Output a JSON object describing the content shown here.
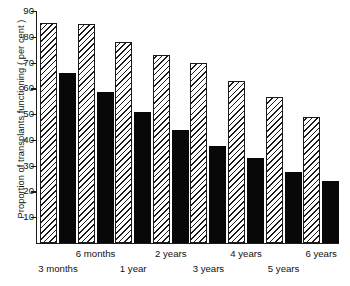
{
  "chart_data": {
    "type": "bar",
    "title": "",
    "xlabel": "",
    "ylabel": "Proportion of transplants functioning ( per cent )",
    "categories": [
      "3 months",
      "6 months",
      "1 year",
      "2 years",
      "3 years",
      "4 years",
      "5 years",
      "6 years"
    ],
    "series": [
      {
        "name": "hatched",
        "values": [
          85.5,
          85,
          78,
          73,
          70,
          63,
          56.5,
          49
        ]
      },
      {
        "name": "solid",
        "values": [
          66,
          58.5,
          51,
          44,
          37.5,
          33,
          27.5,
          24
        ]
      }
    ],
    "ylim": [
      0,
      90
    ],
    "ytick_labels": [
      "90",
      "80",
      "70",
      "60",
      "50",
      "40",
      "30",
      "20",
      "10"
    ],
    "ytick_values": [
      90,
      80,
      70,
      60,
      50,
      40,
      30,
      20,
      10
    ],
    "grid": false,
    "legend": "none"
  },
  "colors": {
    "axis": "#1a1a1a",
    "bar_solid": "#080808",
    "bar_hatched_fill": "#ffffff",
    "background": "#ffffff"
  }
}
